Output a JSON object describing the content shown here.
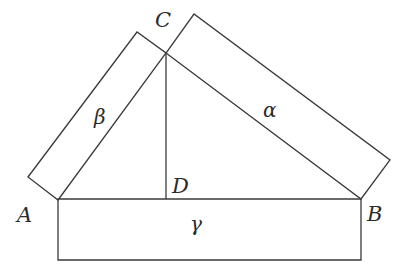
{
  "diagram": {
    "type": "geometry",
    "stroke_color": "#3a3a3a",
    "background": "#ffffff",
    "points": {
      "A": {
        "label": "A",
        "x": 58,
        "y": 200
      },
      "B": {
        "label": "B",
        "x": 361,
        "y": 199
      },
      "C": {
        "label": "C",
        "x": 166,
        "y": 53
      },
      "D": {
        "label": "D",
        "x": 166,
        "y": 199
      }
    },
    "regions": {
      "alpha": {
        "label": "α",
        "polygon": "166,53 361,199 390,160 194,14"
      },
      "beta": {
        "label": "β",
        "polygon": "58,200 166,53 137,32 28,177"
      },
      "gamma": {
        "label": "γ",
        "polygon": "58,199 361,199 361,260 58,260"
      }
    },
    "segments": {
      "altitude_CD": "166,53 166,199",
      "side_AC": "58,200 166,53",
      "side_CB": "166,53 361,199"
    }
  }
}
